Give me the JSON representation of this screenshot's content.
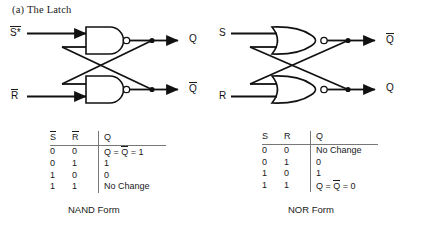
{
  "figure": {
    "caption": "(a) The Latch"
  },
  "circuits": [
    {
      "id": "nand-latch",
      "form_label": "NAND Form",
      "gate_type": "NAND",
      "inputs": [
        {
          "name": "set-input",
          "label": "S*",
          "overbar": true
        },
        {
          "name": "reset-input",
          "label": "R",
          "overbar": true
        }
      ],
      "outputs": [
        {
          "name": "q-output",
          "label": "Q",
          "overbar": false
        },
        {
          "name": "qbar-output",
          "label": "Q",
          "overbar": true
        }
      ]
    },
    {
      "id": "nor-latch",
      "form_label": "NOR Form",
      "gate_type": "NOR",
      "inputs": [
        {
          "name": "set-input",
          "label": "S",
          "overbar": false
        },
        {
          "name": "reset-input",
          "label": "R",
          "overbar": false
        }
      ],
      "outputs": [
        {
          "name": "qbar-output",
          "label": "Q",
          "overbar": true
        },
        {
          "name": "q-output",
          "label": "Q",
          "overbar": false
        }
      ]
    }
  ],
  "tables": {
    "nand": {
      "headers": [
        {
          "text": "S",
          "overbar": true
        },
        {
          "text": "R",
          "overbar": true
        },
        {
          "text": "Q",
          "overbar": false
        }
      ],
      "rows": [
        {
          "a": "0",
          "b": "0",
          "q_prefix": "Q = ",
          "q_bar": "Q",
          "q_suffix": " = 1",
          "q_plain": ""
        },
        {
          "a": "0",
          "b": "1",
          "q_prefix": "",
          "q_bar": "",
          "q_suffix": "",
          "q_plain": "1"
        },
        {
          "a": "1",
          "b": "0",
          "q_prefix": "",
          "q_bar": "",
          "q_suffix": "",
          "q_plain": "0"
        },
        {
          "a": "1",
          "b": "1",
          "q_prefix": "",
          "q_bar": "",
          "q_suffix": "",
          "q_plain": "No Change"
        }
      ]
    },
    "nor": {
      "headers": [
        {
          "text": "S",
          "overbar": false
        },
        {
          "text": "R",
          "overbar": false
        },
        {
          "text": "Q",
          "overbar": false
        }
      ],
      "rows": [
        {
          "a": "0",
          "b": "0",
          "q_prefix": "",
          "q_bar": "",
          "q_suffix": "",
          "q_plain": "No Change"
        },
        {
          "a": "0",
          "b": "1",
          "q_prefix": "",
          "q_bar": "",
          "q_suffix": "",
          "q_plain": "0"
        },
        {
          "a": "1",
          "b": "0",
          "q_prefix": "",
          "q_bar": "",
          "q_suffix": "",
          "q_plain": "1"
        },
        {
          "a": "1",
          "b": "1",
          "q_prefix": "Q = ",
          "q_bar": "Q",
          "q_suffix": " = 0",
          "q_plain": ""
        }
      ]
    }
  },
  "colors": {
    "ink": "#111111",
    "rule": "#777777",
    "background": "#ffffff"
  }
}
